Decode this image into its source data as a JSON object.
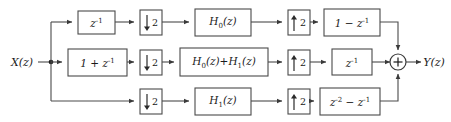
{
  "diagram": {
    "type": "block-diagram",
    "background_color": "#ffffff",
    "line_color": "#4a4a4a",
    "text_color": "#1a1a1a",
    "input": {
      "label": "X(z)",
      "x": 24,
      "y": 62
    },
    "output": {
      "label": "Y(z)",
      "x": 432,
      "y": 62
    },
    "split_node": {
      "x": 51,
      "y": 62
    },
    "adder": {
      "x": 398,
      "y": 62,
      "symbol": "+",
      "radius": 8
    },
    "rows": [
      {
        "name": "top-branch",
        "y": 22,
        "blocks": [
          {
            "name": "delay",
            "label_html": "z<sup>-1</sup>",
            "label_text": "z^-1",
            "x": 78,
            "y": 11,
            "w": 37,
            "h": 23,
            "kind": "transfer"
          },
          {
            "name": "downsampler",
            "label_text": "2",
            "x": 140,
            "y": 10,
            "w": 22,
            "h": 25,
            "kind": "rate-down"
          },
          {
            "name": "analysis-filter",
            "label_html": "H<sub>0</sub>(z)",
            "label_text": "H0(z)",
            "x": 195,
            "y": 9,
            "w": 56,
            "h": 27,
            "kind": "transfer"
          },
          {
            "name": "upsampler",
            "label_text": "2",
            "x": 288,
            "y": 10,
            "w": 22,
            "h": 25,
            "kind": "rate-up"
          },
          {
            "name": "synthesis-filter",
            "label_html": "1 &minus; z<sup>-1</sup>",
            "label_text": "1 - z^-1",
            "x": 324,
            "y": 9,
            "w": 56,
            "h": 27,
            "kind": "transfer"
          }
        ]
      },
      {
        "name": "middle-branch",
        "y": 62,
        "blocks": [
          {
            "name": "comb-filter",
            "label_html": "1 + z<sup>-1</sup>",
            "label_text": "1 + z^-1",
            "x": 68,
            "y": 49,
            "w": 59,
            "h": 27,
            "kind": "transfer"
          },
          {
            "name": "downsampler",
            "label_text": "2",
            "x": 140,
            "y": 50,
            "w": 22,
            "h": 25,
            "kind": "rate-down"
          },
          {
            "name": "analysis-filter",
            "label_html": "H<sub>0</sub>(z)+H<sub>1</sub>(z)",
            "label_text": "H0(z)+H1(z)",
            "x": 180,
            "y": 48,
            "w": 88,
            "h": 28,
            "kind": "transfer"
          },
          {
            "name": "upsampler",
            "label_text": "2",
            "x": 288,
            "y": 50,
            "w": 22,
            "h": 25,
            "kind": "rate-up"
          },
          {
            "name": "delay",
            "label_html": "z<sup>-1</sup>",
            "label_text": "z^-1",
            "x": 332,
            "y": 49,
            "w": 40,
            "h": 26,
            "kind": "transfer"
          }
        ]
      },
      {
        "name": "bottom-branch",
        "y": 101,
        "blocks": [
          {
            "name": "downsampler",
            "label_text": "2",
            "x": 140,
            "y": 89,
            "w": 22,
            "h": 25,
            "kind": "rate-down"
          },
          {
            "name": "analysis-filter",
            "label_html": "H<sub>1</sub>(z)",
            "label_text": "H1(z)",
            "x": 195,
            "y": 88,
            "w": 56,
            "h": 27,
            "kind": "transfer"
          },
          {
            "name": "upsampler",
            "label_text": "2",
            "x": 288,
            "y": 89,
            "w": 22,
            "h": 25,
            "kind": "rate-up"
          },
          {
            "name": "synthesis-filter",
            "label_html": "z<sup>-2</sup> &minus; z<sup>-1</sup>",
            "label_text": "z^-2 - z^-1",
            "x": 320,
            "y": 88,
            "w": 60,
            "h": 27,
            "kind": "transfer"
          }
        ]
      }
    ]
  }
}
